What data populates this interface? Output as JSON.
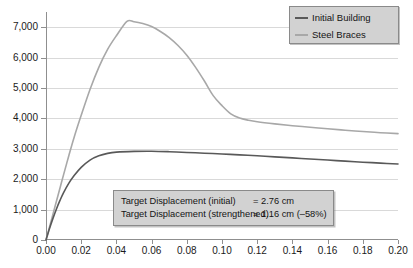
{
  "chart_data": {
    "type": "line",
    "title": "",
    "xlabel": "",
    "ylabel": "",
    "xlim": [
      0.0,
      0.2
    ],
    "ylim": [
      0,
      7500
    ],
    "grid": true,
    "legend_position": "top-right",
    "x_ticks": [
      "0.00",
      "0.02",
      "0.04",
      "0.06",
      "0.08",
      "0.10",
      "0.12",
      "0.14",
      "0.16",
      "0.18",
      "0.20"
    ],
    "y_ticks": [
      "0",
      "1,000",
      "2,000",
      "3,000",
      "4,000",
      "5,000",
      "6,000",
      "7,000"
    ],
    "x_tick_values": [
      0.0,
      0.02,
      0.04,
      0.06,
      0.08,
      0.1,
      0.12,
      0.14,
      0.16,
      0.18,
      0.2
    ],
    "y_tick_values": [
      0,
      1000,
      2000,
      3000,
      4000,
      5000,
      6000,
      7000
    ],
    "series": [
      {
        "name": "Initial Building",
        "color": "#595959",
        "x": [
          0.0,
          0.002,
          0.004,
          0.006,
          0.008,
          0.01,
          0.013,
          0.016,
          0.02,
          0.025,
          0.03,
          0.035,
          0.04,
          0.05,
          0.06,
          0.07,
          0.08,
          0.09,
          0.1,
          0.11,
          0.12,
          0.13,
          0.14,
          0.15,
          0.16,
          0.17,
          0.18,
          0.19,
          0.2
        ],
        "values": [
          0,
          380,
          720,
          1030,
          1310,
          1560,
          1870,
          2120,
          2390,
          2630,
          2770,
          2850,
          2890,
          2915,
          2920,
          2905,
          2880,
          2855,
          2830,
          2800,
          2770,
          2735,
          2700,
          2665,
          2630,
          2595,
          2560,
          2530,
          2500
        ]
      },
      {
        "name": "Steel Braces",
        "color": "#a8a8a8",
        "x": [
          0.0,
          0.002,
          0.004,
          0.006,
          0.008,
          0.01,
          0.013,
          0.016,
          0.02,
          0.025,
          0.03,
          0.035,
          0.04,
          0.046,
          0.05,
          0.055,
          0.06,
          0.065,
          0.07,
          0.075,
          0.08,
          0.085,
          0.09,
          0.095,
          0.1,
          0.105,
          0.11,
          0.115,
          0.12,
          0.13,
          0.14,
          0.15,
          0.16,
          0.17,
          0.18,
          0.19,
          0.2
        ],
        "values": [
          0,
          430,
          860,
          1290,
          1720,
          2150,
          2780,
          3380,
          4100,
          4950,
          5680,
          6270,
          6720,
          7190,
          7180,
          7120,
          7020,
          6860,
          6660,
          6400,
          6080,
          5680,
          5230,
          4750,
          4420,
          4150,
          4010,
          3940,
          3890,
          3820,
          3760,
          3710,
          3660,
          3610,
          3570,
          3530,
          3500
        ]
      }
    ],
    "annotations": {
      "peak_steel_braces": 7200,
      "plateau_initial": 2900
    }
  },
  "legend": {
    "items": [
      {
        "label": "Initial Building",
        "color": "#595959",
        "marker": "line"
      },
      {
        "label": "Steel Braces",
        "color": "#a8a8a8",
        "marker": "line"
      }
    ]
  },
  "annotation_box": {
    "rows": [
      {
        "label": "Target Displacement (initial)",
        "value": "= 2.76 cm"
      },
      {
        "label": "Target Displacement (strengthened)",
        "value": "= 1.16 cm (–58%)"
      }
    ]
  },
  "colors": {
    "initial_building": "#595959",
    "steel_braces": "#a8a8a8",
    "grid": "#d9d9d9",
    "axis": "#8f8f8f",
    "box_fill": "#d2d2d2",
    "box_border": "#8a8a8a",
    "text": "#141414"
  }
}
